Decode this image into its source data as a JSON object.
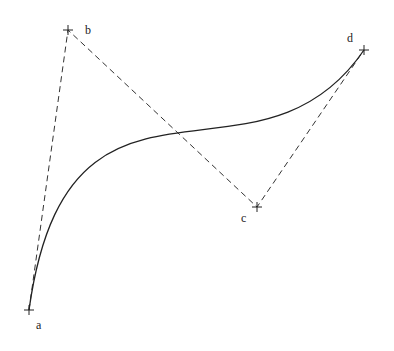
{
  "diagram": {
    "type": "cubic-bezier",
    "stroke_color": "#222222",
    "background": "#ffffff",
    "points": [
      {
        "label": "a",
        "x": 29,
        "y": 310,
        "label_x": 36,
        "label_y": 329
      },
      {
        "label": "b",
        "x": 68,
        "y": 30,
        "label_x": 85,
        "label_y": 34
      },
      {
        "label": "c",
        "x": 257,
        "y": 207,
        "label_x": 241,
        "label_y": 222
      },
      {
        "label": "d",
        "x": 364,
        "y": 50,
        "label_x": 347,
        "label_y": 42
      }
    ]
  }
}
